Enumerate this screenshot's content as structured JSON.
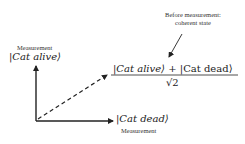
{
  "annotation": {
    "line1": "Before measurement:",
    "line2": "coherent state"
  },
  "y_axis": {
    "label": "Measurement",
    "ket": "|Cat alive⟩"
  },
  "x_axis": {
    "label": "Measurement",
    "ket": "|Cat dead⟩"
  },
  "superposition": {
    "numerator_left": "|Cat alive⟩",
    "plus": "+",
    "numerator_right": "|Cat dead⟩",
    "denominator": "√2"
  },
  "colors": {
    "ink": "#222222",
    "background": "#ffffff"
  }
}
